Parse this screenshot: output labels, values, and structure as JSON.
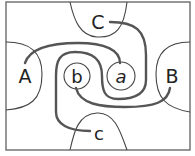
{
  "diagram": {
    "colors": {
      "background": "#ffffff",
      "frame": "#6b6b6b",
      "thin_line": "#444444",
      "thick_path": "#555555",
      "text": "#222222"
    },
    "regions": [
      {
        "id": "A",
        "label": "A",
        "position": "left"
      },
      {
        "id": "B",
        "label": "B",
        "position": "right"
      },
      {
        "id": "C",
        "label": "C",
        "position": "top"
      },
      {
        "id": "c",
        "label": "c",
        "position": "bottom"
      }
    ],
    "circles": [
      {
        "id": "b",
        "label": "b"
      },
      {
        "id": "a",
        "label": "a"
      }
    ],
    "connections": [
      {
        "from": "A",
        "to": "a"
      },
      {
        "from": "b",
        "to": "B"
      },
      {
        "from": "C",
        "to": "c"
      }
    ]
  }
}
